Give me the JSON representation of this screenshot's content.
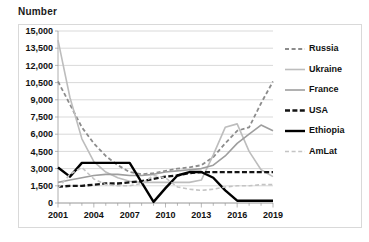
{
  "chart_data": {
    "type": "line",
    "title": "Number",
    "xlabel": "",
    "ylabel": "Number",
    "grid": true,
    "legend_position": "right",
    "xlim": [
      2001,
      2019
    ],
    "ylim": [
      0,
      15000
    ],
    "y_ticks": [
      0,
      1500,
      3000,
      4500,
      6000,
      7500,
      9000,
      10500,
      12000,
      13500,
      15000
    ],
    "y_tick_labels": [
      "0",
      "1,500",
      "3,000",
      "4,500",
      "6,000",
      "7,500",
      "9,000",
      "10,500",
      "12,000",
      "13,500",
      "15,000"
    ],
    "x": [
      2001,
      2002,
      2003,
      2004,
      2005,
      2006,
      2007,
      2008,
      2009,
      2010,
      2011,
      2012,
      2013,
      2014,
      2015,
      2016,
      2017,
      2018,
      2019
    ],
    "x_ticks": [
      2001,
      2004,
      2007,
      2010,
      2013,
      2016,
      2019
    ],
    "x_tick_labels": [
      "2001",
      "2004",
      "2007",
      "2010",
      "2013",
      "2016",
      "2019"
    ],
    "series": [
      {
        "name": "Russia",
        "color": "#8c8c8c",
        "width": 1.8,
        "dash": "4,2.6",
        "values": [
          10600,
          8600,
          6600,
          5200,
          4100,
          3300,
          2700,
          2500,
          2600,
          2800,
          3000,
          3100,
          3300,
          4000,
          5200,
          6300,
          6600,
          8700,
          10600
        ]
      },
      {
        "name": "Ukraine",
        "color": "#bdbdbd",
        "width": 1.6,
        "dash": "",
        "values": [
          14200,
          9200,
          5600,
          3600,
          2700,
          2200,
          1900,
          1800,
          1800,
          1800,
          1800,
          1800,
          2000,
          4200,
          6600,
          6900,
          4500,
          2900,
          2300
        ]
      },
      {
        "name": "France",
        "color": "#9e9e9e",
        "width": 1.6,
        "dash": "",
        "values": [
          1800,
          2000,
          2200,
          2400,
          2500,
          2500,
          2400,
          2400,
          2500,
          2700,
          2800,
          2900,
          3000,
          3300,
          4100,
          5200,
          6000,
          6800,
          6300
        ]
      },
      {
        "name": "USA",
        "color": "#141414",
        "width": 2.3,
        "dash": "5,2.4",
        "values": [
          1400,
          1500,
          1500,
          1600,
          1700,
          1700,
          1800,
          1900,
          2100,
          2300,
          2400,
          2600,
          2700,
          2700,
          2700,
          2700,
          2700,
          2700,
          2700
        ]
      },
      {
        "name": "Ethiopia",
        "color": "#000000",
        "width": 2.4,
        "dash": "",
        "values": [
          3100,
          2300,
          3500,
          3500,
          3500,
          3500,
          3500,
          1800,
          100,
          1300,
          2400,
          2700,
          2700,
          2200,
          1100,
          200,
          200,
          200,
          200
        ]
      },
      {
        "name": "AmLat",
        "color": "#c4c4c4",
        "width": 1.6,
        "dash": "4,2.6",
        "values": [
          1300,
          2500,
          3100,
          2100,
          1600,
          1500,
          1500,
          1700,
          2400,
          2200,
          1400,
          1200,
          1100,
          1200,
          1400,
          1500,
          1500,
          1600,
          1600
        ]
      }
    ]
  }
}
